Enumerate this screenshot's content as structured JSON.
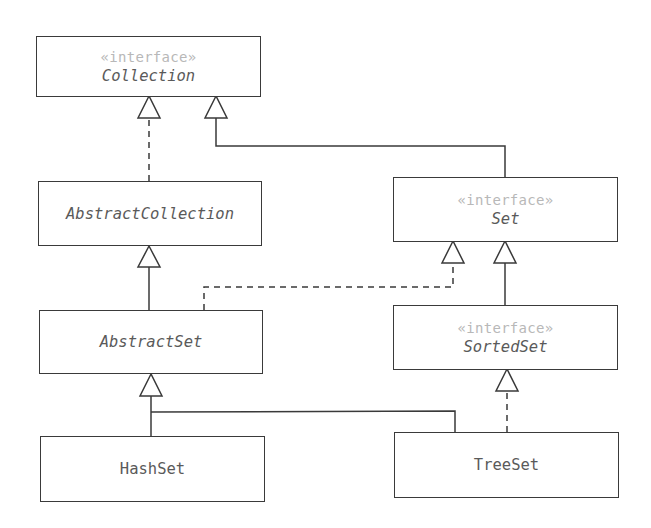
{
  "diagram": {
    "type": "UML class diagram",
    "nodes": [
      {
        "id": "collection",
        "stereotype": "«interface»",
        "name": "Collection",
        "italic": true
      },
      {
        "id": "abstract_collection",
        "stereotype": "",
        "name": "AbstractCollection",
        "italic": true
      },
      {
        "id": "set",
        "stereotype": "«interface»",
        "name": "Set",
        "italic": true
      },
      {
        "id": "abstract_set",
        "stereotype": "",
        "name": "AbstractSet",
        "italic": true
      },
      {
        "id": "sorted_set",
        "stereotype": "«interface»",
        "name": "SortedSet",
        "italic": true
      },
      {
        "id": "hash_set",
        "stereotype": "",
        "name": "HashSet",
        "italic": false
      },
      {
        "id": "tree_set",
        "stereotype": "",
        "name": "TreeSet",
        "italic": false
      }
    ],
    "edges": [
      {
        "from": "AbstractCollection",
        "to": "Collection",
        "kind": "realization",
        "style": "dashed"
      },
      {
        "from": "Set",
        "to": "Collection",
        "kind": "generalization",
        "style": "solid"
      },
      {
        "from": "AbstractSet",
        "to": "AbstractCollection",
        "kind": "generalization",
        "style": "solid"
      },
      {
        "from": "AbstractSet",
        "to": "Set",
        "kind": "realization",
        "style": "dashed"
      },
      {
        "from": "SortedSet",
        "to": "Set",
        "kind": "generalization",
        "style": "solid"
      },
      {
        "from": "HashSet",
        "to": "AbstractSet",
        "kind": "generalization",
        "style": "solid"
      },
      {
        "from": "TreeSet",
        "to": "AbstractSet",
        "kind": "generalization",
        "style": "solid"
      },
      {
        "from": "TreeSet",
        "to": "SortedSet",
        "kind": "realization",
        "style": "dashed"
      }
    ],
    "colors": {
      "line": "#3a3a3a",
      "text": "#5a5a5a",
      "stereotype": "#b8b8b8",
      "background": "#ffffff"
    }
  }
}
